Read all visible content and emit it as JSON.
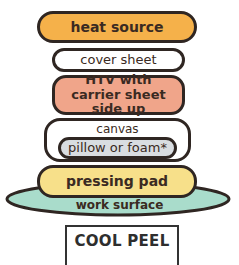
{
  "diagram": {
    "layers": [
      {
        "id": "heat",
        "label": "heat source",
        "color": "#F5B14A"
      },
      {
        "id": "cover",
        "label": "cover sheet",
        "color": "#FFFFFF"
      },
      {
        "id": "htv",
        "label": "HTV with carrier sheet side up",
        "color": "#F0A58A"
      },
      {
        "id": "canvas",
        "label": "canvas",
        "color": "#FFFFFF"
      },
      {
        "id": "pillow",
        "label": "pillow or foam*",
        "color": "#D9DDE1"
      },
      {
        "id": "pad",
        "label": "pressing pad",
        "color": "#F7E08A"
      },
      {
        "id": "surface",
        "label": "work surface",
        "color": "#A9DCCB"
      }
    ],
    "peel_type": "COOL PEEL",
    "outline_color": "#2F2622"
  }
}
